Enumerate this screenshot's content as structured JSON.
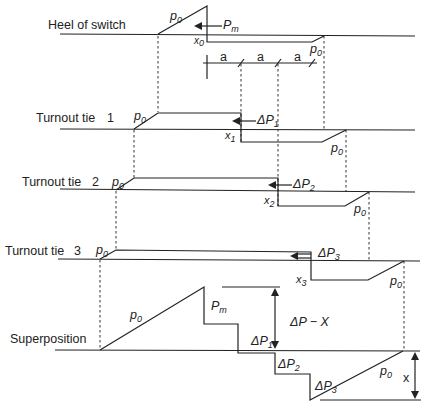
{
  "diagram": {
    "rows": [
      {
        "label": "Heel of switch",
        "number": ""
      },
      {
        "label": "Turnout tie",
        "number": "1"
      },
      {
        "label": "Turnout tie",
        "number": "2"
      },
      {
        "label": "Turnout tie",
        "number": "3"
      },
      {
        "label": "Superposition",
        "number": ""
      }
    ],
    "symbols": {
      "p": "p",
      "p_sub": "0",
      "P": "P",
      "Pm_sub": "m",
      "x": "x",
      "x0_sub": "0",
      "x1_sub": "1",
      "x2_sub": "2",
      "x3_sub": "3",
      "dP": "ΔP",
      "dP1_sub": "1",
      "dP2_sub": "2",
      "dP3_sub": "3",
      "dPX": "ΔP − X",
      "x_dim": "x",
      "spacing": "a"
    }
  }
}
